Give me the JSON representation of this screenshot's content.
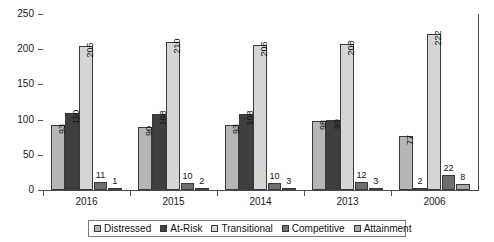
{
  "chart_data": {
    "type": "bar",
    "title": "",
    "subtitle": "",
    "xlabel": "",
    "ylabel": "",
    "categories": [
      "2016",
      "2015",
      "2014",
      "2013",
      "2006"
    ],
    "series": [
      {
        "name": "Distressed",
        "color": "#b6b6b6",
        "values": [
          93,
          90,
          93,
          98,
          77
        ]
      },
      {
        "name": "At-Risk",
        "color": "#3f3f3f",
        "values": [
          110,
          108,
          108,
          99,
          2
        ]
      },
      {
        "name": "Transitional",
        "color": "#d5d5d5",
        "values": [
          205,
          210,
          206,
          208,
          222
        ]
      },
      {
        "name": "Competitive",
        "color": "#6e6e6e",
        "values": [
          11,
          10,
          10,
          12,
          22
        ]
      },
      {
        "name": "Attainment",
        "color": "#a8a8a8",
        "values": [
          1,
          2,
          3,
          3,
          8
        ]
      }
    ],
    "ylim": [
      0,
      250
    ],
    "yticks": [
      0,
      50,
      100,
      150,
      200,
      250
    ],
    "ytick_labels": [
      "0",
      "50",
      "100",
      "150",
      "200",
      "250"
    ],
    "grid": true,
    "grid_axis": "y",
    "legend_position": "bottom",
    "legend_entries": [
      "Distressed",
      "At-Risk",
      "Transitional",
      "Competitive",
      "Attainment"
    ],
    "value_label_threshold": 20
  },
  "legend": {
    "items": [
      {
        "label": "Distressed"
      },
      {
        "label": "At-Risk"
      },
      {
        "label": "Transitional"
      },
      {
        "label": "Competitive"
      },
      {
        "label": "Attainment"
      }
    ]
  }
}
